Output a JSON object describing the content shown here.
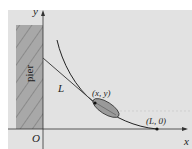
{
  "diagram": {
    "type": "tractrix-pier",
    "labels": {
      "y_axis": "y",
      "x_axis": "x",
      "origin": "O",
      "pier": "pier",
      "rope": "L",
      "point_boat": "(x, y)",
      "point_end": "(L, 0)"
    },
    "colors": {
      "background": "#e2e2e2",
      "pier_fill": "#a8a8a8",
      "pier_hatch": "#888888",
      "curve": "#222222",
      "boat_fill": "#9a9a9a"
    }
  }
}
